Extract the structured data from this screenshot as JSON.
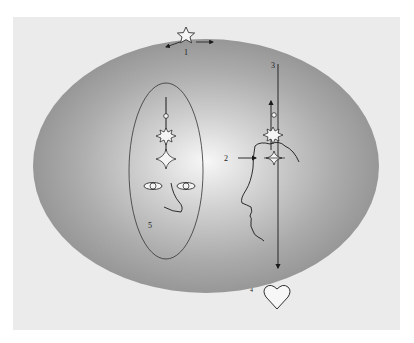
{
  "figure": {
    "colors": {
      "background": "#ffffff",
      "panel": "#ebebeb",
      "ellipse_center": "#f6f6f6",
      "ellipse_edge": "#9a9a9a",
      "stroke": "#1a1a1a"
    },
    "labels": [
      {
        "id": "1",
        "text": "1"
      },
      {
        "id": "2",
        "text": "2"
      },
      {
        "id": "3",
        "text": "3"
      },
      {
        "id": "4",
        "text": "4"
      },
      {
        "id": "5",
        "text": "5"
      }
    ],
    "symbols": {
      "top": "star-icon",
      "bottom": "heart-icon",
      "face_column": [
        "circle",
        "starburst",
        "four-point-star"
      ],
      "profile_column": [
        "circle",
        "starburst",
        "four-point-star"
      ]
    }
  }
}
